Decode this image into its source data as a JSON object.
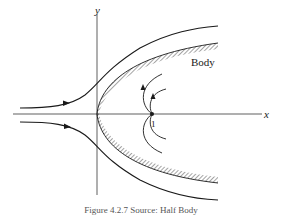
{
  "figure": {
    "axis_labels": {
      "x": "x",
      "y": "y"
    },
    "body_label": "Body",
    "stagnation_point_label": "1",
    "caption": "Figure 4.2.7 Source: Half Body",
    "colors": {
      "ink": "#1a1a1a",
      "background": "#ffffff"
    },
    "elements": [
      "upper-streamline-with-arrow",
      "lower-streamline-with-arrow",
      "hatched-half-body-boundary",
      "source-streamlines-near-point-1"
    ]
  }
}
